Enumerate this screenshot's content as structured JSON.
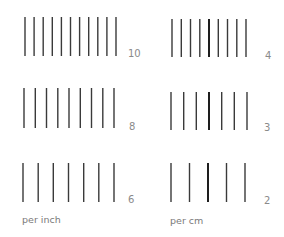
{
  "diagram": {
    "colors": {
      "line": "#3a3a3a",
      "line_bold": "#1e1e1e",
      "label": "#8a8a8a"
    },
    "groups": [
      {
        "id": "inch-10",
        "label": "10",
        "count": 11,
        "x_start": 25,
        "x_end": 116,
        "y_top": 17,
        "y_bottom": 56,
        "label_x": 128,
        "label_y": 49,
        "bold_index": -1
      },
      {
        "id": "inch-8",
        "label": "8",
        "count": 9,
        "x_start": 24,
        "x_end": 114,
        "y_top": 88,
        "y_bottom": 128,
        "label_x": 129,
        "label_y": 122,
        "bold_index": -1
      },
      {
        "id": "inch-6",
        "label": "6",
        "count": 7,
        "x_start": 23,
        "x_end": 114,
        "y_top": 163,
        "y_bottom": 202,
        "label_x": 128,
        "label_y": 195,
        "bold_index": -1
      },
      {
        "id": "cm-4",
        "label": "4",
        "count": 9,
        "x_start": 172,
        "x_end": 246,
        "y_top": 19,
        "y_bottom": 57,
        "label_x": 265,
        "label_y": 51,
        "bold_index": 4
      },
      {
        "id": "cm-3",
        "label": "3",
        "count": 7,
        "x_start": 171,
        "x_end": 247,
        "y_top": 92,
        "y_bottom": 130,
        "label_x": 264,
        "label_y": 123,
        "bold_index": 3
      },
      {
        "id": "cm-2",
        "label": "2",
        "count": 5,
        "x_start": 171,
        "x_end": 245,
        "y_top": 163,
        "y_bottom": 202,
        "label_x": 264,
        "label_y": 196,
        "bold_index": 2
      }
    ],
    "captions": {
      "per_inch": "per inch",
      "per_cm": "per cm"
    }
  }
}
